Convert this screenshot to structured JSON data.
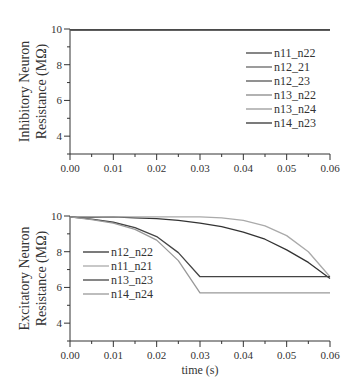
{
  "chart_data": [
    {
      "type": "line",
      "title": "",
      "xlabel": "",
      "ylabel": "Inhibitory Neuron Resistance (MΩ)",
      "ylabel_lines": [
        "Inhibitory Neuron",
        "Resistance (MΩ)"
      ],
      "xlim": [
        0,
        0.06
      ],
      "ylim": [
        3,
        10
      ],
      "xticks": [
        "0.00",
        "0.01",
        "0.02",
        "0.03",
        "0.04",
        "0.05",
        "0.06"
      ],
      "yticks": [
        "4",
        "6",
        "8",
        "10"
      ],
      "grid": false,
      "legend_position": "center-right",
      "x": [
        0,
        0.01,
        0.02,
        0.03,
        0.04,
        0.05,
        0.06
      ],
      "series": [
        {
          "name": "n11_n22",
          "color": "#444444",
          "values": [
            9.95,
            9.95,
            9.96,
            9.97,
            9.96,
            9.95,
            9.95
          ]
        },
        {
          "name": "n12_21",
          "color": "#666666",
          "values": [
            9.95,
            9.94,
            9.95,
            9.96,
            9.95,
            9.95,
            9.95
          ]
        },
        {
          "name": "n12_23",
          "color": "#555555",
          "values": [
            9.95,
            9.95,
            9.95,
            9.96,
            9.96,
            9.95,
            9.95
          ]
        },
        {
          "name": "n13_n22",
          "color": "#888888",
          "values": [
            9.95,
            9.95,
            9.94,
            9.95,
            9.95,
            9.95,
            9.95
          ]
        },
        {
          "name": "n13_n24",
          "color": "#999999",
          "values": [
            9.95,
            9.95,
            9.95,
            9.95,
            9.95,
            9.95,
            9.95
          ]
        },
        {
          "name": "n14_n23",
          "color": "#333333",
          "values": [
            9.95,
            9.95,
            9.95,
            9.95,
            9.95,
            9.95,
            9.95
          ]
        }
      ]
    },
    {
      "type": "line",
      "title": "",
      "xlabel": "time (s)",
      "ylabel": "Excitatory Neuron Resistance (MΩ)",
      "ylabel_lines": [
        "Excitatory Neuron",
        "Resistance (MΩ)"
      ],
      "xlim": [
        0,
        0.06
      ],
      "ylim": [
        3,
        10
      ],
      "xticks": [
        "0.00",
        "0.01",
        "0.02",
        "0.03",
        "0.04",
        "0.05",
        "0.06"
      ],
      "yticks": [
        "4",
        "6",
        "8",
        "10"
      ],
      "grid": false,
      "legend_position": "center-left",
      "x": [
        0,
        0.005,
        0.01,
        0.015,
        0.02,
        0.025,
        0.03,
        0.035,
        0.04,
        0.045,
        0.05,
        0.055,
        0.06
      ],
      "series": [
        {
          "name": "n12_n22",
          "color": "#333333",
          "values": [
            9.95,
            9.93,
            9.95,
            9.9,
            9.85,
            9.75,
            9.6,
            9.4,
            9.1,
            8.7,
            8.1,
            7.4,
            6.5
          ]
        },
        {
          "name": "n11_n21",
          "color": "#aaaaaa",
          "values": [
            9.95,
            9.95,
            9.95,
            9.95,
            9.95,
            9.95,
            9.95,
            9.9,
            9.75,
            9.45,
            8.9,
            8.0,
            6.6
          ]
        },
        {
          "name": "n13_n23",
          "color": "#444444",
          "values": [
            9.95,
            9.82,
            9.65,
            9.35,
            8.85,
            7.95,
            6.6,
            6.6,
            6.6,
            6.6,
            6.6,
            6.6,
            6.6
          ]
        },
        {
          "name": "n14_n24",
          "color": "#999999",
          "values": [
            9.95,
            9.8,
            9.6,
            9.25,
            8.65,
            7.5,
            5.7,
            5.7,
            5.7,
            5.7,
            5.7,
            5.7,
            5.7
          ]
        }
      ]
    }
  ]
}
